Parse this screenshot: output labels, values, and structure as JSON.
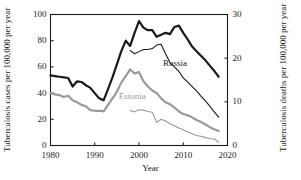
{
  "chart_data": {
    "type": "line",
    "title": "",
    "xlabel": "Year",
    "ylabel": "Tuberculosis cases per 100,000 per year",
    "ylabel_right": "Tuberculosis deaths per 100,000 per year",
    "xlim": [
      1980,
      2020
    ],
    "ylim": [
      0,
      100
    ],
    "ylim_right": [
      0,
      30
    ],
    "xticks": [
      "1980",
      "1990",
      "2000",
      "2010",
      "2020"
    ],
    "xtick_values": [
      1980,
      1990,
      2000,
      2010,
      2020
    ],
    "yticks_left": [
      "0",
      "20",
      "40",
      "60",
      "80",
      "100"
    ],
    "ytick_values_left": [
      0,
      20,
      40,
      60,
      80,
      100
    ],
    "yticks_right": [
      "0",
      "10",
      "20",
      "30"
    ],
    "ytick_values_right": [
      0,
      10,
      20,
      30
    ],
    "grid": false,
    "legend_position": "inline-annotation",
    "annotations": [
      {
        "text": "Russia",
        "color": "#1a1a1a",
        "x": 2009.5,
        "y": 62
      },
      {
        "text": "Estonia",
        "color": "#999999",
        "x": 1999.5,
        "y": 37
      }
    ],
    "colors": {
      "russia": "#1a1a1a",
      "estonia": "#999999"
    },
    "series": [
      {
        "name": "Russia tuberculosis cases",
        "country": "Russia",
        "measure": "cases",
        "axis": "left",
        "color": "#1a1a1a",
        "line_width": 2.2,
        "x": [
          1980,
          1981,
          1982,
          1983,
          1984,
          1985,
          1986,
          1987,
          1988,
          1989,
          1990,
          1991,
          1992,
          1993,
          1994,
          1995,
          1996,
          1997,
          1998,
          1999,
          2000,
          2001,
          2002,
          2003,
          2004,
          2005,
          2006,
          2007,
          2008,
          2009,
          2010,
          2011,
          2012,
          2013,
          2014,
          2015,
          2016,
          2017,
          2018
        ],
        "values": [
          53.5,
          53.0,
          52.5,
          52.0,
          51.5,
          45.0,
          49.0,
          48.5,
          46.0,
          44.0,
          40.0,
          36.0,
          34.5,
          43.0,
          52.0,
          62.0,
          72.0,
          80.0,
          76.0,
          86.0,
          95.0,
          90.0,
          88.0,
          88.0,
          83.0,
          84.5,
          86.0,
          85.0,
          90.5,
          91.5,
          86.0,
          81.0,
          75.5,
          72.0,
          68.5,
          65.0,
          61.0,
          57.0,
          52.5
        ]
      },
      {
        "name": "Estonia tuberculosis cases",
        "country": "Estonia",
        "measure": "cases",
        "axis": "left",
        "color": "#999999",
        "line_width": 2.2,
        "x": [
          1980,
          1981,
          1982,
          1983,
          1984,
          1985,
          1986,
          1987,
          1988,
          1989,
          1990,
          1991,
          1992,
          1993,
          1994,
          1995,
          1996,
          1997,
          1998,
          1999,
          2000,
          2001,
          2002,
          2003,
          2004,
          2005,
          2006,
          2007,
          2008,
          2009,
          2010,
          2011,
          2012,
          2013,
          2014,
          2015,
          2016,
          2017,
          2018
        ],
        "values": [
          40.0,
          39.0,
          38.5,
          37.0,
          38.0,
          34.5,
          33.0,
          31.0,
          30.0,
          27.0,
          26.5,
          26.5,
          26.0,
          31.0,
          36.0,
          41.0,
          48.0,
          53.0,
          58.0,
          55.0,
          56.0,
          49.0,
          45.0,
          42.0,
          40.0,
          36.0,
          33.0,
          31.5,
          29.0,
          26.0,
          24.0,
          23.0,
          21.5,
          19.5,
          18.0,
          16.0,
          14.0,
          12.5,
          11.0
        ]
      },
      {
        "name": "Russia tuberculosis deaths",
        "country": "Russia",
        "measure": "deaths",
        "axis": "right",
        "color": "#1a1a1a",
        "line_width": 1.1,
        "x": [
          1998,
          1999,
          2000,
          2001,
          2002,
          2003,
          2004,
          2005,
          2006,
          2007,
          2008,
          2009,
          2010,
          2011,
          2012,
          2013,
          2014,
          2015,
          2016,
          2017,
          2018
        ],
        "values": [
          21.8,
          21.0,
          21.5,
          22.0,
          22.0,
          22.2,
          23.0,
          23.2,
          21.0,
          19.0,
          18.0,
          17.0,
          15.5,
          14.5,
          13.5,
          12.5,
          11.3,
          10.2,
          9.0,
          7.7,
          6.5
        ]
      },
      {
        "name": "Estonia tuberculosis deaths",
        "country": "Estonia",
        "measure": "deaths",
        "axis": "right",
        "color": "#999999",
        "line_width": 1.1,
        "x": [
          1998,
          1999,
          2000,
          2001,
          2002,
          2003,
          2004,
          2005,
          2006,
          2007,
          2008,
          2009,
          2010,
          2011,
          2012,
          2013,
          2014,
          2015,
          2016,
          2017,
          2018
        ],
        "values": [
          8.0,
          7.7,
          8.2,
          8.1,
          7.8,
          7.6,
          5.3,
          6.0,
          5.6,
          5.0,
          4.5,
          4.0,
          3.6,
          3.1,
          2.7,
          2.3,
          2.1,
          1.8,
          1.6,
          1.5,
          0.8
        ]
      }
    ]
  }
}
